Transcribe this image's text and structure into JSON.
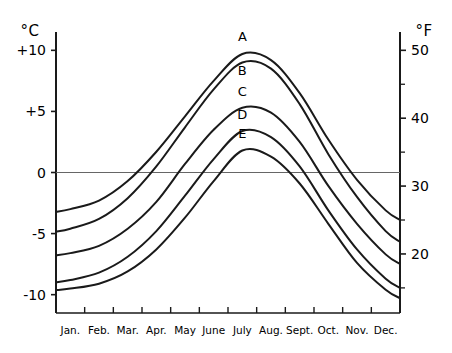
{
  "chart_data": {
    "type": "line",
    "title": "",
    "subtitle": "",
    "xlabel": "",
    "ylabel": "°C",
    "y2label": "°F",
    "grid": false,
    "legend_position": "inline-curve-labels",
    "categories": [
      "Jan.",
      "Feb.",
      "Mar.",
      "Apr.",
      "May",
      "June",
      "July",
      "Aug.",
      "Sept.",
      "Oct.",
      "Nov.",
      "Dec."
    ],
    "x_tick_labels": [
      "Jan.",
      "Feb.",
      "Mar.",
      "Apr.",
      "May",
      "June",
      "July",
      "Aug.",
      "Sept.",
      "Oct.",
      "Nov.",
      "Dec."
    ],
    "ylim": [
      -11.5,
      11.5
    ],
    "y_tick_labels": [
      "+10",
      "+5",
      "0",
      "-5",
      "-10"
    ],
    "y_tick_values": [
      10,
      5,
      0,
      -5,
      -10
    ],
    "y2lim": [
      11.3,
      50.7
    ],
    "y2_tick_labels": [
      "50",
      "40",
      "30",
      "20"
    ],
    "y2_tick_values": [
      50,
      40,
      30,
      20
    ],
    "y2_minor_tick_values": [
      45,
      35,
      25,
      15
    ],
    "zero_line": 0,
    "annotations": [
      {
        "text": "A",
        "x": "July",
        "y": 10.8
      },
      {
        "text": "B",
        "x": "July",
        "y": 8.0
      },
      {
        "text": "C",
        "x": "July",
        "y": 6.3
      },
      {
        "text": "D",
        "x": "July",
        "y": 4.4
      },
      {
        "text": "E",
        "x": "July",
        "y": 2.8
      }
    ],
    "series": [
      {
        "name": "A",
        "label": "A",
        "values": [
          -3.0,
          -2.3,
          -0.7,
          1.7,
          4.6,
          7.5,
          9.7,
          9.2,
          6.5,
          2.7,
          -0.6,
          -3.1
        ]
      },
      {
        "name": "B",
        "label": "B",
        "values": [
          -4.6,
          -3.8,
          -2.1,
          0.5,
          3.7,
          6.8,
          9.0,
          8.5,
          5.6,
          1.5,
          -2.0,
          -4.8
        ]
      },
      {
        "name": "C",
        "label": "C",
        "values": [
          -6.6,
          -6.0,
          -4.6,
          -2.4,
          0.7,
          3.5,
          5.3,
          4.9,
          2.5,
          -1.1,
          -4.2,
          -6.7
        ]
      },
      {
        "name": "D",
        "label": "D",
        "values": [
          -8.8,
          -8.2,
          -6.9,
          -4.8,
          -1.9,
          1.1,
          3.4,
          2.9,
          0.5,
          -3.1,
          -6.3,
          -8.7
        ]
      },
      {
        "name": "E",
        "label": "E",
        "values": [
          -9.5,
          -9.1,
          -8.1,
          -6.3,
          -3.7,
          -0.7,
          1.8,
          1.3,
          -0.9,
          -4.2,
          -7.4,
          -9.6
        ]
      }
    ]
  }
}
